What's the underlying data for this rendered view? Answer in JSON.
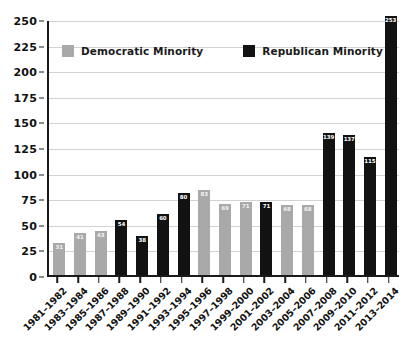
{
  "chart_data": {
    "type": "bar",
    "title": "",
    "subtitle": "",
    "xlabel": "",
    "ylabel": "",
    "ylim": [
      0,
      250
    ],
    "ytick_step": 25,
    "yticks": [
      0,
      25,
      50,
      75,
      100,
      125,
      150,
      175,
      200,
      225,
      250
    ],
    "grid": true,
    "legend_position": "top-left-inside",
    "categories": [
      "1981–1982",
      "1983–1984",
      "1985–1986",
      "1987–1988",
      "1989–1990",
      "1991–1992",
      "1993–1994",
      "1995–1996",
      "1997–1998",
      "1999–2000",
      "2001–2002",
      "2003–2004",
      "2005–2006",
      "2007–2008",
      "2009–2010",
      "2011–2012",
      "2013–2014"
    ],
    "values": [
      31,
      41,
      43,
      54,
      38,
      60,
      80,
      83,
      69,
      71,
      71,
      68,
      68,
      139,
      137,
      115,
      253
    ],
    "point_series": [
      "Democratic Minority",
      "Democratic Minority",
      "Democratic Minority",
      "Republican Minority",
      "Republican Minority",
      "Republican Minority",
      "Republican Minority",
      "Democratic Minority",
      "Democratic Minority",
      "Democratic Minority",
      "Republican Minority",
      "Democratic Minority",
      "Democratic Minority",
      "Republican Minority",
      "Republican Minority",
      "Republican Minority",
      "Republican Minority"
    ],
    "series": [
      {
        "name": "Democratic Minority",
        "color": "#a9a9a9",
        "values": [
          31,
          41,
          43,
          null,
          null,
          null,
          null,
          83,
          69,
          71,
          null,
          68,
          68,
          null,
          null,
          null,
          null
        ]
      },
      {
        "name": "Republican Minority",
        "color": "#121212",
        "values": [
          null,
          null,
          null,
          54,
          38,
          60,
          80,
          null,
          null,
          null,
          71,
          null,
          null,
          139,
          137,
          115,
          253
        ]
      }
    ]
  },
  "legend": {
    "items": [
      {
        "label": "Democratic Minority",
        "color": "#a9a9a9",
        "key": "dem"
      },
      {
        "label": "Republican Minority",
        "color": "#121212",
        "key": "rep"
      }
    ]
  },
  "colors": {
    "democratic": "#a9a9a9",
    "republican": "#121212",
    "axis": "#1a1a1a",
    "gridline": "#d2d2d2",
    "background": "#ffffff"
  }
}
